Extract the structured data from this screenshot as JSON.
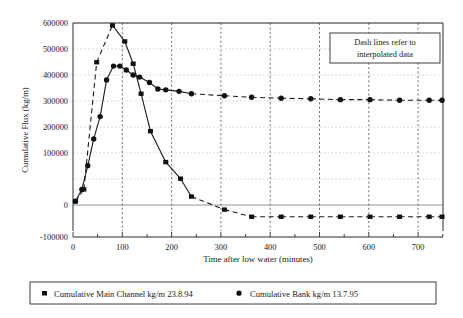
{
  "chart_data": {
    "type": "line",
    "title": "",
    "xlabel": "Time after low water (minutes)",
    "ylabel": "Cumulative Flux (kg/m)",
    "xlim": [
      0,
      750
    ],
    "ylim": [
      -100000,
      600000
    ],
    "xticks": [
      0,
      100,
      200,
      300,
      400,
      500,
      600,
      700
    ],
    "xtick_labels": [
      "0",
      "100",
      "200",
      "300",
      "400",
      "500",
      "600",
      "700"
    ],
    "xminor_step": 50,
    "yticks": [
      -100000,
      0,
      100000,
      200000,
      300000,
      400000,
      500000,
      600000
    ],
    "ytick_labels": [
      "-100000",
      "0",
      "100000",
      "200000",
      "300000",
      "400000",
      "500000",
      "600000"
    ],
    "grid": "vertical dashed major, horizontal dotted light",
    "legend_position": "below-plot",
    "annotations": [
      {
        "name": "dash-note",
        "text_line1": "Dash lines refer to",
        "text_line2": "interpolated data",
        "x": 520,
        "y": 520
      }
    ],
    "series": [
      {
        "name": "Cumulative Main Channel kg/m 23.8.94",
        "marker": "square",
        "line": "mixed solid and dashed (dashed = interpolated)",
        "color": "#111111",
        "points": [
          [
            5,
            0
          ],
          [
            22,
            40000
          ],
          [
            48,
            468000
          ],
          [
            80,
            592000
          ],
          [
            105,
            538000
          ],
          [
            122,
            463000
          ],
          [
            138,
            362000
          ],
          [
            157,
            236000
          ],
          [
            188,
            132000
          ],
          [
            218,
            76000
          ],
          [
            240,
            16000
          ],
          [
            307,
            -28000
          ],
          [
            362,
            -52000
          ],
          [
            422,
            -52000
          ],
          [
            482,
            -52000
          ],
          [
            542,
            -52000
          ],
          [
            602,
            -52000
          ],
          [
            662,
            -52000
          ],
          [
            722,
            -52000
          ],
          [
            748,
            -52000
          ]
        ],
        "dashed_segments": [
          [
            0,
            3
          ],
          [
            10,
            12
          ]
        ]
      },
      {
        "name": "Cumulative Bank kg/m 13.7.95",
        "marker": "circle",
        "line": "solid then dashed tail (dashed = interpolated)",
        "color": "#111111",
        "points": [
          [
            5,
            0
          ],
          [
            18,
            40000
          ],
          [
            30,
            120000
          ],
          [
            42,
            210000
          ],
          [
            55,
            285000
          ],
          [
            68,
            408000
          ],
          [
            82,
            455000
          ],
          [
            95,
            455000
          ],
          [
            108,
            442000
          ],
          [
            122,
            425000
          ],
          [
            135,
            418000
          ],
          [
            155,
            400000
          ],
          [
            172,
            378000
          ],
          [
            188,
            375000
          ],
          [
            215,
            370000
          ],
          [
            240,
            362000
          ],
          [
            307,
            355000
          ],
          [
            362,
            350000
          ],
          [
            422,
            347000
          ],
          [
            482,
            345000
          ],
          [
            542,
            342000
          ],
          [
            602,
            342000
          ],
          [
            662,
            340000
          ],
          [
            722,
            340000
          ],
          [
            748,
            340000
          ]
        ]
      }
    ]
  },
  "legend": {
    "entries": [
      {
        "marker": "square",
        "label": "Cumulative Main Channel kg/m 23.8.94"
      },
      {
        "marker": "circle",
        "label": "Cumulative Bank kg/m 13.7.95"
      }
    ]
  },
  "colors": {
    "ink": "#111111",
    "frame": "#2a2a2a",
    "grid_major": "#555555",
    "grid_minor": "#bdbdbd",
    "background": "#ffffff"
  }
}
